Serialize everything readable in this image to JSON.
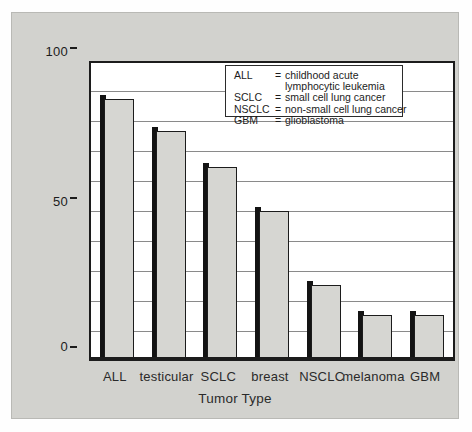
{
  "chart_data": {
    "type": "bar",
    "title": "",
    "xlabel": "Tumor Type",
    "ylabel": "Response Rate (estimated)",
    "categories": [
      "ALL",
      "testicular",
      "SCLC",
      "breast",
      "NSCLC",
      "melanoma",
      "GBM"
    ],
    "values": [
      88,
      77,
      65,
      50,
      25,
      15,
      15
    ],
    "ylim": [
      0,
      100
    ],
    "ytick_labels": [
      "100",
      "50",
      "0"
    ],
    "ytick_values": [
      100,
      50,
      0
    ],
    "gridlines": [
      10,
      20,
      30,
      40,
      50,
      60,
      70,
      80,
      90
    ],
    "grid": true,
    "legend_position": "inside-top-right",
    "bar_fill_color": "#d6d6d2",
    "bar_edge_color": "#1c1c1c",
    "panel_color": "#d2d2ce",
    "plot_background": "#ffffff"
  },
  "legend": {
    "entries": [
      {
        "abbr": "ALL",
        "eq": "=",
        "definition": "childhood acute",
        "continuation": "lymphocytic leukemia"
      },
      {
        "abbr": "SCLC",
        "eq": "=",
        "definition": "small cell lung cancer",
        "continuation": ""
      },
      {
        "abbr": "NSCLC",
        "eq": "=",
        "definition": "non-small cell lung cancer",
        "continuation": ""
      },
      {
        "abbr": "GBM",
        "eq": "=",
        "definition": "glioblastoma",
        "continuation": ""
      }
    ]
  }
}
